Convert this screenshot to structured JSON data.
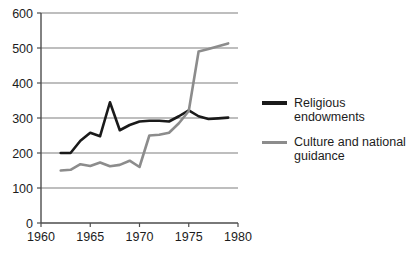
{
  "chart_data": {
    "type": "line",
    "title": "",
    "subtitle": "",
    "xlabel": "",
    "ylabel": "",
    "xlim": [
      1960,
      1980
    ],
    "ylim": [
      0,
      600
    ],
    "xticks": [
      1960,
      1965,
      1970,
      1975,
      1980
    ],
    "yticks": [
      0,
      100,
      200,
      300,
      400,
      500,
      600
    ],
    "grid": "horizontal",
    "legend_position": "right",
    "x": [
      1962,
      1963,
      1964,
      1965,
      1966,
      1967,
      1968,
      1969,
      1970,
      1971,
      1972,
      1973,
      1974,
      1975,
      1976,
      1977,
      1978,
      1979
    ],
    "series": [
      {
        "name": "Religious endowments",
        "color": "#1a1a1a",
        "values": [
          200,
          200,
          235,
          258,
          248,
          345,
          265,
          280,
          290,
          292,
          292,
          290,
          305,
          322,
          305,
          297,
          299,
          301
        ]
      },
      {
        "name": "Culture and national guidance",
        "color": "#8c8c8c",
        "values": [
          150,
          152,
          168,
          163,
          173,
          162,
          166,
          178,
          160,
          250,
          252,
          258,
          285,
          320,
          490,
          497,
          505,
          513
        ]
      }
    ]
  },
  "axis": {
    "y_tick_labels": [
      "600",
      "500",
      "400",
      "300",
      "200",
      "100",
      "0"
    ],
    "x_tick_labels": [
      "1960",
      "1965",
      "1970",
      "1975",
      "1980"
    ]
  },
  "legend": {
    "items": [
      {
        "label": "Religious\nendowments",
        "color": "#1a1a1a",
        "swatch": "black"
      },
      {
        "label": "Culture and national\nguidance",
        "color": "#8c8c8c",
        "swatch": "grey"
      }
    ]
  },
  "colors": {
    "series_black": "#1a1a1a",
    "series_grey": "#8c8c8c",
    "gridline": "#a8a8a8",
    "axis": "#4d4d4d",
    "background": "#ffffff",
    "text": "#1c1c1c"
  }
}
